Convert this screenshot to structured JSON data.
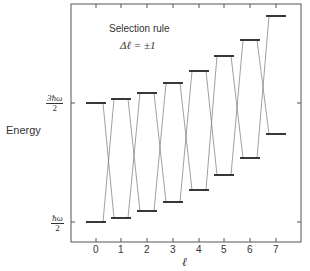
{
  "y_axis": {
    "label": "Energy",
    "ticks": [
      {
        "label_num": "3ħω",
        "label_den": "2",
        "y": 103
      },
      {
        "label_num": "ħω",
        "label_den": "2",
        "y": 222
      }
    ]
  },
  "x_axis": {
    "label": "ℓ",
    "ticks": [
      "0",
      "1",
      "2",
      "3",
      "4",
      "5",
      "6",
      "7"
    ]
  },
  "annotation": {
    "line1": "Selection rule",
    "line2": "Δℓ = ±1"
  },
  "levels": {
    "upper": [
      103,
      99,
      93,
      83,
      71,
      56,
      40,
      16
    ],
    "lower": [
      222,
      218,
      211,
      202,
      190,
      175,
      158,
      134
    ]
  },
  "colors": {
    "axis": "#555555",
    "level": "#222222",
    "transition": "#777777"
  }
}
